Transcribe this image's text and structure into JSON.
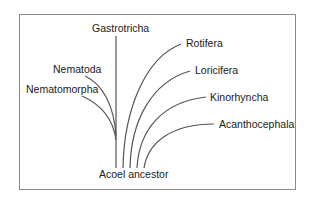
{
  "diagram": {
    "type": "phylogenetic-tree",
    "root": {
      "label": "Acoel ancestor"
    },
    "taxa": [
      {
        "id": "nematomorpha",
        "label": "Nematomorpha"
      },
      {
        "id": "nematoda",
        "label": "Nematoda"
      },
      {
        "id": "gastrotricha",
        "label": "Gastrotricha"
      },
      {
        "id": "rotifera",
        "label": "Rotifera"
      },
      {
        "id": "loricifera",
        "label": "Loricifera"
      },
      {
        "id": "kinorhyncha",
        "label": "Kinorhyncha"
      },
      {
        "id": "acanthocephala",
        "label": "Acanthocephala"
      }
    ],
    "colors": {
      "line": "#555555",
      "text": "#1a1a1a",
      "frame": "#8a8a8a"
    }
  }
}
